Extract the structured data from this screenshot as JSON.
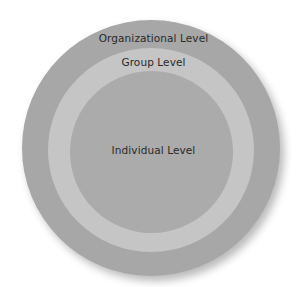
{
  "diagram": {
    "type": "concentric-circles",
    "levels": [
      {
        "label": "Organizational Level",
        "color": "#a7a7a7"
      },
      {
        "label": "Group Level",
        "color": "#c5c5c5"
      },
      {
        "label": "Individual Level",
        "color": "#ababab"
      }
    ]
  }
}
